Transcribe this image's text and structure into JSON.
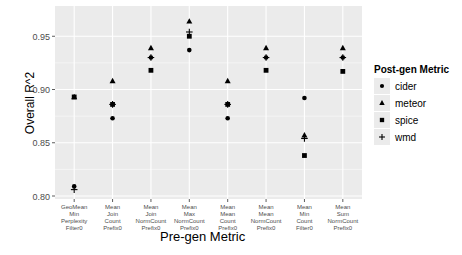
{
  "chart_data": {
    "type": "scatter",
    "title": "",
    "xlabel": "Pre-gen Metric",
    "ylabel": "Overall R^2",
    "ylim": [
      0.797,
      0.973
    ],
    "yticks": [
      0.8,
      0.85,
      0.9,
      0.95
    ],
    "ytick_labels": [
      "0.80",
      "0.85",
      "0.90",
      "0.95"
    ],
    "grid": true,
    "legend_position": "right",
    "legend_title": "Post-gen Metric",
    "categories": [
      [
        "GeoMean",
        "Min",
        "Perplexity",
        "Filter0"
      ],
      [
        "Mean",
        "Join",
        "Count",
        "Prefix0"
      ],
      [
        "Mean",
        "Join",
        "NormCount",
        "Prefix0"
      ],
      [
        "Mean",
        "Max",
        "NormCount",
        "Prefix0"
      ],
      [
        "Mean",
        "Mean",
        "Count",
        "Prefix0"
      ],
      [
        "Mean",
        "Mean",
        "NormCount",
        "Prefix0"
      ],
      [
        "Mean",
        "Min",
        "Count",
        "Filter0"
      ],
      [
        "Mean",
        "Sum",
        "NormCount",
        "Prefix0"
      ]
    ],
    "series": [
      {
        "name": "cider",
        "marker": "circle",
        "values": [
          0.809,
          0.873,
          0.93,
          0.937,
          0.873,
          0.93,
          0.892,
          0.93
        ]
      },
      {
        "name": "meteor",
        "marker": "triangle",
        "values": [
          0.893,
          0.908,
          0.939,
          0.964,
          0.908,
          0.939,
          0.857,
          0.939
        ]
      },
      {
        "name": "spice",
        "marker": "square",
        "values": [
          0.893,
          0.886,
          0.918,
          0.95,
          0.886,
          0.918,
          0.838,
          0.917
        ]
      },
      {
        "name": "wmd",
        "marker": "plus",
        "values": [
          0.806,
          0.886,
          0.93,
          0.954,
          0.886,
          0.93,
          0.854,
          0.93
        ]
      }
    ]
  },
  "colors": {
    "panel": "#ebebeb",
    "grid": "#ffffff",
    "marker": "#000000",
    "axis_text": "#4d4d4d"
  }
}
